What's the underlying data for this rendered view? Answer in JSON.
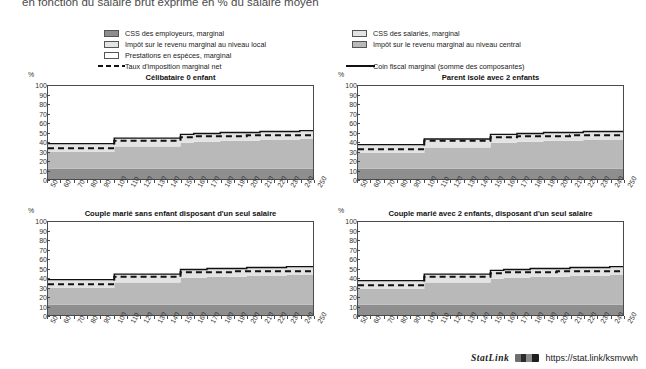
{
  "page": {
    "title": "en fonction du salaire brut exprimé en % du salaire moyen"
  },
  "legend_left": {
    "items": [
      {
        "label": "CSS des employeurs, marginal",
        "swatch": "dark-gray",
        "color": "#8e8e8e",
        "type": "area"
      },
      {
        "label": "Impôt sur le revenu marginal au niveau local",
        "swatch": "light-gray",
        "color": "#e3e3e3",
        "type": "area"
      },
      {
        "label": "Prestations en espèces, marginal",
        "swatch": "white",
        "color": "#ffffff",
        "type": "area"
      },
      {
        "label": "Taux d'imposition marginal net",
        "swatch": "dashed-line",
        "color": "#111111",
        "type": "line-dashed"
      }
    ]
  },
  "legend_right": {
    "items": [
      {
        "label": "CSS des salariés, marginal",
        "swatch": "light-gray",
        "color": "#e3e3e3",
        "type": "area"
      },
      {
        "label": "Impôt sur le revenu marginal au niveau central",
        "swatch": "mid-gray",
        "color": "#b9b9b9",
        "type": "area"
      },
      {
        "label": "Coin fiscal marginal (somme des composantes)",
        "swatch": "solid-line",
        "color": "#111111",
        "type": "line-solid"
      }
    ]
  },
  "axis": {
    "y_unit": "%",
    "y_ticks": [
      0,
      10,
      20,
      30,
      40,
      50,
      60,
      70,
      80,
      90,
      100
    ],
    "x_ticks": [
      50,
      60,
      70,
      80,
      90,
      100,
      110,
      120,
      130,
      140,
      150,
      160,
      170,
      180,
      190,
      200,
      210,
      220,
      230,
      240,
      250
    ]
  },
  "footer": {
    "statlink_label": "StatLink",
    "url": "https://stat.link/ksmvwh"
  },
  "chart_data": {
    "type": "area",
    "title": "en fonction du salaire brut exprimé en % du salaire moyen",
    "xlabel": "",
    "ylabel": "%",
    "xlim": [
      50,
      250
    ],
    "ylim": [
      0,
      100
    ],
    "grid": false,
    "legend_position": "top",
    "stack_order": [
      "employer_sc",
      "central_income_tax",
      "local_income_tax",
      "employee_sc",
      "cash_benefits"
    ],
    "panels": [
      {
        "title": "Célibataire 0 enfant",
        "x": [
          50,
          60,
          70,
          80,
          90,
          100,
          110,
          120,
          130,
          140,
          150,
          160,
          170,
          180,
          190,
          200,
          210,
          220,
          230,
          240,
          250
        ],
        "series": [
          {
            "name": "CSS des employeurs, marginal",
            "key": "employer_sc",
            "color": "#8e8e8e",
            "values": [
              11,
              11,
              11,
              11,
              11,
              11,
              11,
              11,
              11,
              11,
              11,
              11,
              11,
              11,
              11,
              11,
              11,
              11,
              11,
              11,
              11
            ]
          },
          {
            "name": "CSS des salariés, marginal",
            "key": "employee_sc",
            "color": "#e3e3e3",
            "values": [
              9,
              9,
              9,
              9,
              9,
              9,
              9,
              9,
              9,
              9,
              9,
              9,
              9,
              9,
              9,
              9,
              9,
              9,
              9,
              9,
              9
            ]
          },
          {
            "name": "Impôt sur le revenu marginal au niveau central",
            "key": "central_income_tax",
            "color": "#b9b9b9",
            "values": [
              18,
              18,
              18,
              18,
              18,
              24,
              24,
              24,
              24,
              24,
              28,
              29,
              29,
              30,
              30,
              30,
              31,
              31,
              31,
              32,
              32
            ]
          },
          {
            "name": "Impôt sur le revenu marginal au niveau local",
            "key": "local_income_tax",
            "color": "#e3e3e3",
            "values": [
              0,
              0,
              0,
              0,
              0,
              0,
              0,
              0,
              0,
              0,
              0,
              0,
              0,
              0,
              0,
              0,
              0,
              0,
              0,
              0,
              0
            ]
          },
          {
            "name": "Prestations en espèces, marginal",
            "key": "cash_benefits",
            "color": "#ffffff",
            "values": [
              0,
              0,
              0,
              0,
              0,
              0,
              0,
              0,
              0,
              0,
              0,
              0,
              0,
              0,
              0,
              0,
              0,
              0,
              0,
              0,
              0
            ]
          }
        ],
        "lines": [
          {
            "name": "Taux d'imposition marginal net",
            "style": "dashed",
            "color": "#111111",
            "values": [
              33,
              33,
              33,
              33,
              33,
              41,
              41,
              41,
              41,
              41,
              45,
              46,
              46,
              46,
              46,
              47,
              47,
              47,
              47,
              47,
              47
            ]
          },
          {
            "name": "Coin fiscal marginal (somme des composantes)",
            "style": "solid",
            "color": "#111111",
            "values": [
              38,
              38,
              38,
              38,
              38,
              44,
              44,
              44,
              44,
              44,
              48,
              49,
              49,
              50,
              50,
              50,
              51,
              51,
              51,
              52,
              52
            ]
          }
        ]
      },
      {
        "title": "Parent isolé avec 2 enfants",
        "x": [
          50,
          60,
          70,
          80,
          90,
          100,
          110,
          120,
          130,
          140,
          150,
          160,
          170,
          180,
          190,
          200,
          210,
          220,
          230,
          240,
          250
        ],
        "series": [
          {
            "name": "CSS des employeurs, marginal",
            "key": "employer_sc",
            "color": "#8e8e8e",
            "values": [
              11,
              11,
              11,
              11,
              11,
              11,
              11,
              11,
              11,
              11,
              11,
              11,
              11,
              11,
              11,
              11,
              11,
              11,
              11,
              11,
              11
            ]
          },
          {
            "name": "CSS des salariés, marginal",
            "key": "employee_sc",
            "color": "#e3e3e3",
            "values": [
              9,
              9,
              9,
              9,
              9,
              9,
              9,
              9,
              9,
              9,
              9,
              9,
              9,
              9,
              9,
              9,
              9,
              9,
              9,
              9,
              9
            ]
          },
          {
            "name": "Impôt sur le revenu marginal au niveau central",
            "key": "central_income_tax",
            "color": "#b9b9b9",
            "values": [
              17,
              17,
              17,
              17,
              17,
              23,
              23,
              23,
              23,
              23,
              28,
              28,
              29,
              29,
              30,
              30,
              30,
              31,
              31,
              31,
              32
            ]
          },
          {
            "name": "Impôt sur le revenu marginal au niveau local",
            "key": "local_income_tax",
            "color": "#e3e3e3",
            "values": [
              0,
              0,
              0,
              0,
              0,
              0,
              0,
              0,
              0,
              0,
              0,
              0,
              0,
              0,
              0,
              0,
              0,
              0,
              0,
              0,
              0
            ]
          },
          {
            "name": "Prestations en espèces, marginal",
            "key": "cash_benefits",
            "color": "#ffffff",
            "values": [
              0,
              0,
              0,
              0,
              0,
              0,
              0,
              0,
              0,
              0,
              0,
              0,
              0,
              0,
              0,
              0,
              0,
              0,
              0,
              0,
              0
            ]
          }
        ],
        "lines": [
          {
            "name": "Taux d'imposition marginal net",
            "style": "dashed",
            "color": "#111111",
            "values": [
              32,
              32,
              32,
              32,
              32,
              41,
              41,
              41,
              41,
              41,
              45,
              45,
              46,
              46,
              46,
              46,
              47,
              47,
              47,
              47,
              47
            ]
          },
          {
            "name": "Coin fiscal marginal (somme des composantes)",
            "style": "solid",
            "color": "#111111",
            "values": [
              37,
              37,
              37,
              37,
              37,
              43,
              43,
              43,
              43,
              43,
              48,
              48,
              49,
              49,
              50,
              50,
              50,
              51,
              51,
              51,
              52
            ]
          }
        ]
      },
      {
        "title": "Couple marié sans enfant disposant d'un seul salaire",
        "x": [
          50,
          60,
          70,
          80,
          90,
          100,
          110,
          120,
          130,
          140,
          150,
          160,
          170,
          180,
          190,
          200,
          210,
          220,
          230,
          240,
          250
        ],
        "series": [
          {
            "name": "CSS des employeurs, marginal",
            "key": "employer_sc",
            "color": "#8e8e8e",
            "values": [
              11,
              11,
              11,
              11,
              11,
              11,
              11,
              11,
              11,
              11,
              11,
              11,
              11,
              11,
              11,
              11,
              11,
              11,
              11,
              11,
              11
            ]
          },
          {
            "name": "CSS des salariés, marginal",
            "key": "employee_sc",
            "color": "#e3e3e3",
            "values": [
              9,
              9,
              9,
              9,
              9,
              9,
              9,
              9,
              9,
              9,
              9,
              9,
              9,
              9,
              9,
              9,
              9,
              9,
              9,
              9,
              9
            ]
          },
          {
            "name": "Impôt sur le revenu marginal au niveau central",
            "key": "central_income_tax",
            "color": "#b9b9b9",
            "values": [
              18,
              18,
              18,
              18,
              18,
              24,
              24,
              24,
              24,
              24,
              29,
              29,
              30,
              30,
              30,
              31,
              31,
              31,
              32,
              32,
              32
            ]
          },
          {
            "name": "Impôt sur le revenu marginal au niveau local",
            "key": "local_income_tax",
            "color": "#e3e3e3",
            "values": [
              0,
              0,
              0,
              0,
              0,
              0,
              0,
              0,
              0,
              0,
              0,
              0,
              0,
              0,
              0,
              0,
              0,
              0,
              0,
              0,
              0
            ]
          },
          {
            "name": "Prestations en espèces, marginal",
            "key": "cash_benefits",
            "color": "#ffffff",
            "values": [
              0,
              0,
              0,
              0,
              0,
              0,
              0,
              0,
              0,
              0,
              0,
              0,
              0,
              0,
              0,
              0,
              0,
              0,
              0,
              0,
              0
            ]
          }
        ],
        "lines": [
          {
            "name": "Taux d'imposition marginal net",
            "style": "dashed",
            "color": "#111111",
            "values": [
              33,
              33,
              33,
              33,
              33,
              41,
              41,
              41,
              41,
              41,
              46,
              46,
              46,
              46,
              47,
              47,
              47,
              47,
              47,
              47,
              47
            ]
          },
          {
            "name": "Coin fiscal marginal (somme des composantes)",
            "style": "solid",
            "color": "#111111",
            "values": [
              38,
              38,
              38,
              38,
              38,
              44,
              44,
              44,
              44,
              44,
              49,
              49,
              50,
              50,
              50,
              51,
              51,
              51,
              52,
              52,
              52
            ]
          }
        ]
      },
      {
        "title": "Couple marié avec 2 enfants, disposant d'un seul salaire",
        "x": [
          50,
          60,
          70,
          80,
          90,
          100,
          110,
          120,
          130,
          140,
          150,
          160,
          170,
          180,
          190,
          200,
          210,
          220,
          230,
          240,
          250
        ],
        "series": [
          {
            "name": "CSS des employeurs, marginal",
            "key": "employer_sc",
            "color": "#8e8e8e",
            "values": [
              11,
              11,
              11,
              11,
              11,
              11,
              11,
              11,
              11,
              11,
              11,
              11,
              11,
              11,
              11,
              11,
              11,
              11,
              11,
              11,
              11
            ]
          },
          {
            "name": "CSS des salariés, marginal",
            "key": "employee_sc",
            "color": "#e3e3e3",
            "values": [
              9,
              9,
              9,
              9,
              9,
              9,
              9,
              9,
              9,
              9,
              9,
              9,
              9,
              9,
              9,
              9,
              9,
              9,
              9,
              9,
              9
            ]
          },
          {
            "name": "Impôt sur le revenu marginal au niveau central",
            "key": "central_income_tax",
            "color": "#b9b9b9",
            "values": [
              17,
              17,
              17,
              17,
              17,
              24,
              24,
              24,
              24,
              24,
              28,
              29,
              29,
              30,
              30,
              30,
              31,
              31,
              31,
              32,
              32
            ]
          },
          {
            "name": "Impôt sur le revenu marginal au niveau local",
            "key": "local_income_tax",
            "color": "#e3e3e3",
            "values": [
              0,
              0,
              0,
              0,
              0,
              0,
              0,
              0,
              0,
              0,
              0,
              0,
              0,
              0,
              0,
              0,
              0,
              0,
              0,
              0,
              0
            ]
          },
          {
            "name": "Prestations en espèces, marginal",
            "key": "cash_benefits",
            "color": "#ffffff",
            "values": [
              0,
              0,
              0,
              0,
              0,
              0,
              0,
              0,
              0,
              0,
              0,
              0,
              0,
              0,
              0,
              0,
              0,
              0,
              0,
              0,
              0
            ]
          }
        ],
        "lines": [
          {
            "name": "Taux d'imposition marginal net",
            "style": "dashed",
            "color": "#111111",
            "values": [
              32,
              32,
              32,
              32,
              32,
              41,
              41,
              41,
              41,
              41,
              45,
              46,
              46,
              46,
              46,
              47,
              47,
              47,
              47,
              47,
              47
            ]
          },
          {
            "name": "Coin fiscal marginal (somme des composantes)",
            "style": "solid",
            "color": "#111111",
            "values": [
              37,
              37,
              37,
              37,
              37,
              44,
              44,
              44,
              44,
              44,
              48,
              49,
              49,
              50,
              50,
              50,
              51,
              51,
              51,
              52,
              52
            ]
          }
        ]
      }
    ]
  }
}
